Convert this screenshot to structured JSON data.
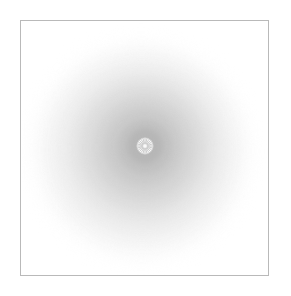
{
  "figure": {
    "background_color": "#ffffff",
    "frame": {
      "stroke_color": "#b9b9b9",
      "stroke_width_px": 1.5,
      "x": 20,
      "y": 20,
      "width": 249,
      "height": 256
    },
    "center": {
      "x": 145,
      "y": 146
    }
  },
  "chart_data": {
    "type": "pie",
    "subtitle": "",
    "xlabel": "",
    "ylabel": "",
    "legend": [],
    "annotations": [],
    "grid": false,
    "categories": [
      "ring-9-outermost",
      "ring-8",
      "ring-7",
      "ring-6",
      "ring-5",
      "ring-4",
      "ring-3",
      "ring-2",
      "ring-1-core",
      "center-rosette"
    ],
    "values": [
      108,
      98,
      88,
      76,
      64,
      52,
      40,
      28,
      18,
      9
    ],
    "ylim": [
      0,
      110
    ],
    "series": [
      {
        "name": "radius_px",
        "values": [
          108,
          98,
          88,
          76,
          64,
          52,
          40,
          28,
          18,
          9
        ]
      },
      {
        "name": "fill_hex",
        "values": [
          "#fbfbfb",
          "#f5f5f5",
          "#efefef",
          "#e7e7e7",
          "#dedede",
          "#d5d5d5",
          "#cbcbcb",
          "#c2c2c2",
          "#b6b6b6",
          "#f7f7f7"
        ]
      },
      {
        "name": "blur_px",
        "values": [
          9,
          8,
          7,
          6,
          5,
          4,
          4,
          3,
          3,
          1
        ]
      },
      {
        "name": "center_offset_x_px",
        "values": [
          -4,
          -3,
          -3,
          -2,
          -2,
          -1,
          -1,
          0,
          0,
          0
        ]
      },
      {
        "name": "center_offset_y_px",
        "values": [
          5,
          4,
          4,
          3,
          2,
          2,
          1,
          1,
          0,
          0
        ]
      }
    ]
  },
  "rosette": {
    "spoke_count": 24,
    "inner_radius_px": 2.2,
    "outer_radius_px": 8.2,
    "spoke_color": "#a9a9a9",
    "disc_color": "#f9f9f9",
    "rim_color": "#cdcdcd",
    "hub_color": "#d6d6d6"
  }
}
